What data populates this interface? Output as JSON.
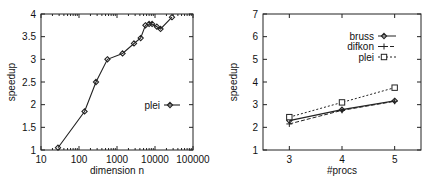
{
  "chart_data": [
    {
      "type": "line",
      "xscale": "log",
      "title": "",
      "xlabel": "dimension n",
      "ylabel": "speedup",
      "xlim": [
        10,
        100000
      ],
      "ylim": [
        1,
        4
      ],
      "x_ticks": [
        "10",
        "100",
        "1000",
        "10000",
        "100000"
      ],
      "y_ticks": [
        "1",
        "1.5",
        "2",
        "2.5",
        "3",
        "3.5",
        "4"
      ],
      "grid": false,
      "legend_position": "right-middle",
      "series": [
        {
          "name": "plei",
          "marker": "diamond",
          "line": "solid",
          "x": [
            28,
            140,
            280,
            560,
            1400,
            2800,
            4200,
            5600,
            7000,
            8400,
            11200,
            14000,
            28000
          ],
          "values": [
            1.05,
            1.85,
            2.5,
            3.0,
            3.13,
            3.35,
            3.47,
            3.75,
            3.78,
            3.78,
            3.72,
            3.67,
            3.93
          ]
        }
      ]
    },
    {
      "type": "line",
      "title": "",
      "xlabel": "#procs",
      "ylabel": "speedup",
      "xlim": [
        2.5,
        5.5
      ],
      "ylim": [
        1,
        7
      ],
      "categories": [
        "3",
        "4",
        "5"
      ],
      "x": [
        3,
        4,
        5
      ],
      "x_ticks": [
        "3",
        "4",
        "5"
      ],
      "y_ticks": [
        "1",
        "2",
        "3",
        "4",
        "5",
        "6",
        "7"
      ],
      "grid": false,
      "legend_position": "top-right",
      "series": [
        {
          "name": "bruss",
          "marker": "diamond",
          "line": "solid",
          "values": [
            2.3,
            2.78,
            3.17
          ]
        },
        {
          "name": "difkon",
          "marker": "plus",
          "line": "dashed",
          "values": [
            2.15,
            2.75,
            3.15
          ]
        },
        {
          "name": "plei",
          "marker": "square",
          "line": "dotted",
          "values": [
            2.45,
            3.1,
            3.75
          ]
        }
      ]
    }
  ]
}
